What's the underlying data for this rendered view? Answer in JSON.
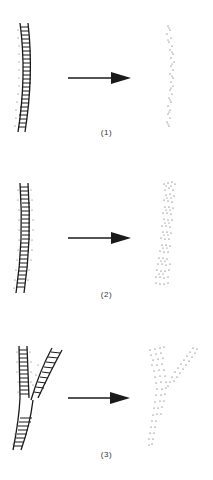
{
  "figure": {
    "panels": [
      {
        "id": 1,
        "label": "(1)",
        "before": "single-ladder-curved",
        "after": "narrow-stippled-band"
      },
      {
        "id": 2,
        "label": "(2)",
        "before": "single-ladder-with-side-dots",
        "after": "wide-stippled-band"
      },
      {
        "id": 3,
        "label": "(3)",
        "before": "branching-ladder-y",
        "after": "branching-stippled-y"
      }
    ],
    "arrow_icon": "right-arrow",
    "colors": {
      "ink": "#1a1a1a",
      "stipple": "#444444",
      "background": "#ffffff"
    }
  }
}
